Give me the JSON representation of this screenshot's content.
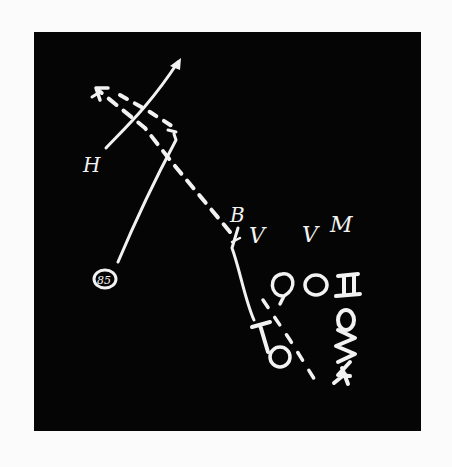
{
  "diagram": {
    "type": "football-play-chalkboard",
    "colors": {
      "board": "#050505",
      "chalk": "#f2f2f2",
      "page": "#fbfbfb"
    },
    "players": [
      {
        "id": "H",
        "label": "H",
        "shape": "letter"
      },
      {
        "id": "85",
        "label": "85",
        "shape": "circled-number"
      },
      {
        "id": "B",
        "label": "B",
        "shape": "letter"
      },
      {
        "id": "V1",
        "label": "V",
        "shape": "letter"
      },
      {
        "id": "V2",
        "label": "V",
        "shape": "letter"
      },
      {
        "id": "M",
        "label": "M",
        "shape": "letter"
      },
      {
        "id": "QB-circle-1",
        "label": "O",
        "shape": "circle"
      },
      {
        "id": "QB-circle-2",
        "label": "O",
        "shape": "circle"
      },
      {
        "id": "center-square",
        "label": "□",
        "shape": "square"
      },
      {
        "id": "T",
        "label": "T",
        "shape": "tee"
      },
      {
        "id": "bottom-circle",
        "label": "O",
        "shape": "circle"
      },
      {
        "id": "O-right",
        "label": "O",
        "shape": "circle"
      },
      {
        "id": "E-rot",
        "label": "E",
        "shape": "letter-rotated"
      },
      {
        "id": "W-rot",
        "label": "W",
        "shape": "letter-rotated"
      }
    ],
    "routes": [
      {
        "name": "dashed-deep-route",
        "style": "dashed",
        "arrow": true
      },
      {
        "name": "solid-crossing-route",
        "style": "solid",
        "arrow": true
      },
      {
        "name": "85-route",
        "style": "solid",
        "arrow": false
      },
      {
        "name": "B-run-path",
        "style": "solid",
        "arrow": false
      },
      {
        "name": "lower-dashed-route",
        "style": "dashed",
        "arrow": false
      }
    ]
  }
}
